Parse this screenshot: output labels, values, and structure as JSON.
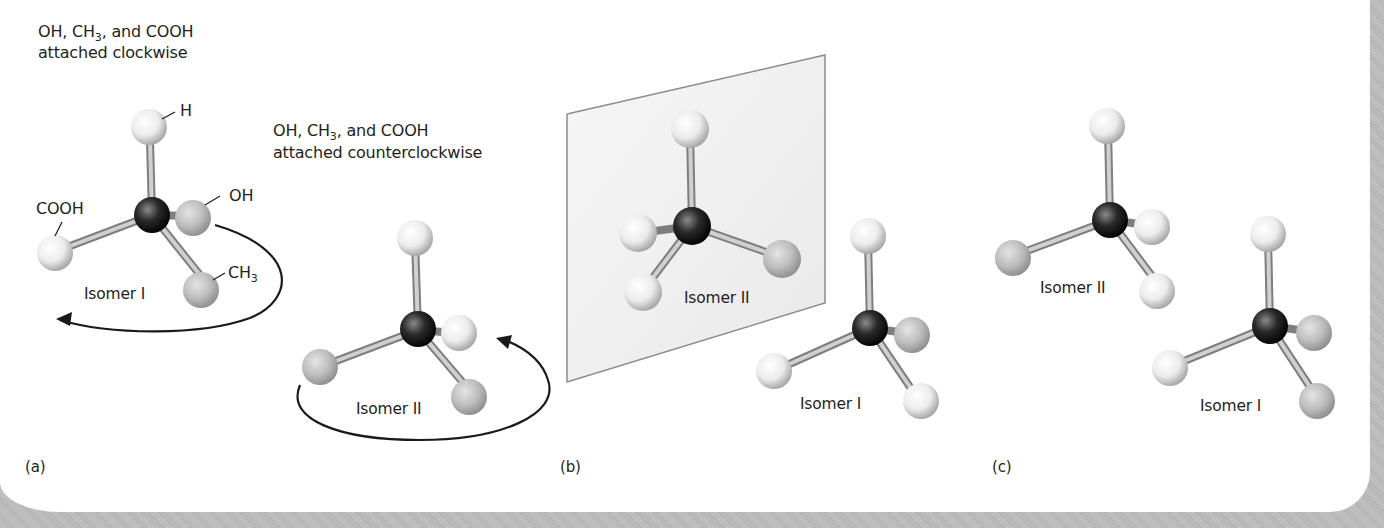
{
  "figure": {
    "top_partial_text": "…",
    "panel_a": {
      "caption": "(a)",
      "isomer1": {
        "heading_line1_pre": "OH, CH",
        "heading_line1_sub": "3",
        "heading_line1_post": ", and COOH",
        "heading_line2": "attached clockwise",
        "label": "Isomer I",
        "atom_labels": {
          "h": "H",
          "oh": "OH",
          "cooh": "COOH",
          "ch3_pre": "CH",
          "ch3_sub": "3"
        },
        "rotation": "clockwise"
      },
      "isomer2": {
        "heading_line1_pre": "OH, CH",
        "heading_line1_sub": "3",
        "heading_line1_post": ", and COOH",
        "heading_line2": "attached counterclockwise",
        "label": "Isomer II",
        "rotation": "counterclockwise"
      }
    },
    "panel_b": {
      "caption": "(b)",
      "mirror_isomer_label": "Isomer II",
      "front_isomer_label": "Isomer I"
    },
    "panel_c": {
      "caption": "(c)",
      "back_isomer_label": "Isomer II",
      "front_isomer_label": "Isomer I"
    },
    "colors": {
      "carbon": "#1a1a1a",
      "light_atom": "#f2f2f2",
      "gray_atom": "#b8b8b8",
      "bond": "#9a9a9a",
      "arrow": "#1a1a1a",
      "text": "#231f20",
      "frame": "#b9b9b9"
    }
  }
}
